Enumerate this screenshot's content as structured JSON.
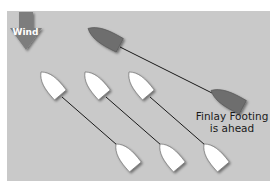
{
  "wind": {
    "label": "Wind",
    "arrow_color": "#7d7d7d",
    "direction": "down"
  },
  "caption": {
    "line1": "Finlay Footing",
    "line2": "is ahead"
  },
  "colors": {
    "panel_bg": "#c9c9c9",
    "dark_boat": "#6e6e6e",
    "white_boat": "#ffffff",
    "line": "#1a1a1a"
  },
  "boats": {
    "dark": [
      {
        "name": "dark-boat-upper",
        "x": 106,
        "y": 38,
        "angle": 30
      },
      {
        "name": "dark-boat-lower",
        "x": 229,
        "y": 100,
        "angle": 30
      }
    ],
    "white_top": [
      {
        "name": "white-boat-top-1",
        "x": 52,
        "y": 85
      },
      {
        "name": "white-boat-top-2",
        "x": 96,
        "y": 85
      },
      {
        "name": "white-boat-top-3",
        "x": 140,
        "y": 85
      }
    ],
    "white_bottom": [
      {
        "name": "white-boat-bottom-1",
        "x": 127,
        "y": 157
      },
      {
        "name": "white-boat-bottom-2",
        "x": 171,
        "y": 157
      },
      {
        "name": "white-boat-bottom-3",
        "x": 215,
        "y": 157
      }
    ]
  }
}
